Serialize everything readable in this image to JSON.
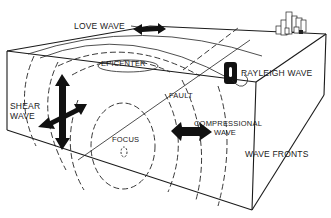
{
  "diagram": {
    "labels": {
      "love_wave": "LOVE WAVE",
      "epicenter": "EPICENTER",
      "rayleigh_wave": "RAYLEIGH WAVE",
      "shear_line1": "SHEAR",
      "shear_line2": "WAVE",
      "fault": "FAULT",
      "focus": "FOCUS",
      "compressional_line1": "COMPRESSIONAL",
      "compressional_line2": "WAVE",
      "wave_fronts": "WAVE FRONTS"
    },
    "icons": [
      "love-wave-arrow-icon",
      "shear-wave-cross-arrow-icon",
      "compressional-wave-arrow-icon",
      "rayleigh-wave-loop-icon",
      "buildings-icon"
    ],
    "colors": {
      "ink": "#1a1a1a",
      "background": "#ffffff"
    }
  }
}
